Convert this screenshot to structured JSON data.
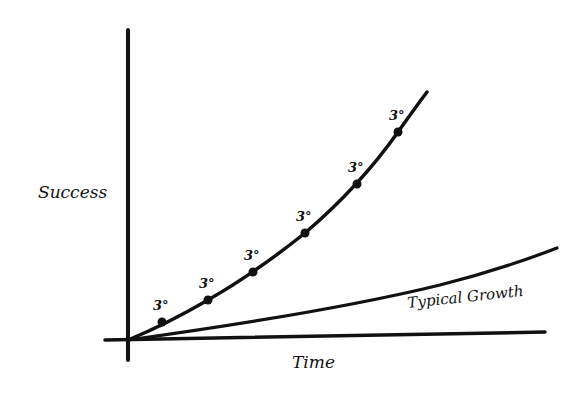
{
  "chart_data": {
    "type": "line",
    "title": "",
    "xlabel": "Time",
    "ylabel": "Success",
    "grid": false,
    "legend": "none",
    "axes": {
      "origin": [
        128,
        340
      ],
      "y_axis": {
        "x": 128,
        "top": 30,
        "bottom": 360
      },
      "x_axis": {
        "y": 340,
        "left": 105,
        "right": 545
      }
    },
    "series": [
      {
        "name": "Compounding 3° growth",
        "style": "curve",
        "points": [
          [
            128,
            340
          ],
          [
            162,
            322
          ],
          [
            208,
            300
          ],
          [
            253,
            272
          ],
          [
            305,
            233
          ],
          [
            357,
            184
          ],
          [
            398,
            132
          ],
          [
            427,
            92
          ]
        ],
        "markers": [
          {
            "x": 162,
            "y": 322,
            "label": "3°"
          },
          {
            "x": 208,
            "y": 300,
            "label": "3°"
          },
          {
            "x": 253,
            "y": 272,
            "label": "3°"
          },
          {
            "x": 305,
            "y": 233,
            "label": "3°"
          },
          {
            "x": 357,
            "y": 184,
            "label": "3°"
          },
          {
            "x": 398,
            "y": 132,
            "label": "3°"
          }
        ]
      },
      {
        "name": "Typical Growth",
        "style": "line",
        "points": [
          [
            128,
            340
          ],
          [
            300,
            310
          ],
          [
            450,
            282
          ],
          [
            557,
            248
          ]
        ],
        "label": "Typical Growth"
      }
    ]
  },
  "labels": {
    "y_axis": "Success",
    "x_axis": "Time",
    "typical": "Typical Growth",
    "marker": "3°"
  },
  "colors": {
    "ink": "#111111",
    "background": "#ffffff"
  }
}
